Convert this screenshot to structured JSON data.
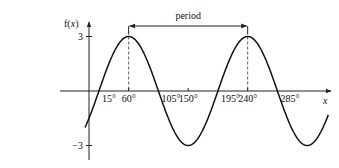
{
  "chart_data": {
    "type": "line",
    "title": "",
    "function": "f(x) = 3 sin(2(x - 15°))",
    "amplitude": 3,
    "period_deg": 180,
    "phase_shift_deg": 15,
    "xlabel": "x",
    "ylabel": "f(x)",
    "x_range_deg": [
      -6,
      362
    ],
    "ylim": [
      -3,
      3
    ],
    "x_ticks": [
      {
        "value": 15,
        "label": "15°"
      },
      {
        "value": 60,
        "label": "60°"
      },
      {
        "value": 105,
        "label": "105°"
      },
      {
        "value": 150,
        "label": "150°"
      },
      {
        "value": 195,
        "label": "195°"
      },
      {
        "value": 240,
        "label": "240°"
      },
      {
        "value": 285,
        "label": "285°"
      }
    ],
    "y_ticks": [
      {
        "value": 3,
        "label": "3"
      },
      {
        "value": -3,
        "label": "−3"
      }
    ],
    "dashed_guides_at": [
      60,
      240
    ],
    "annotation": {
      "text": "period",
      "from": 60,
      "to": 240
    },
    "grid": false,
    "legend": "none"
  }
}
